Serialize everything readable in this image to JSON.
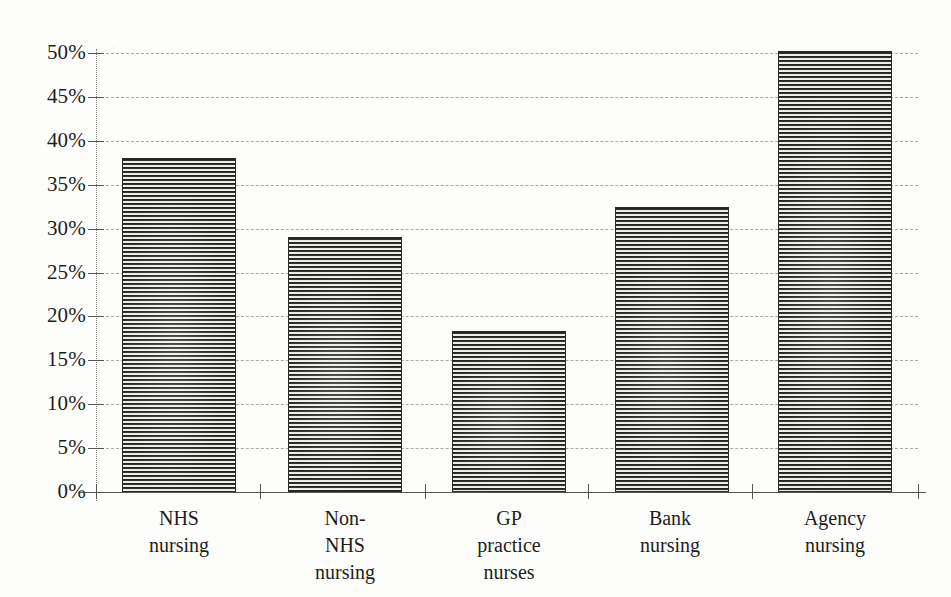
{
  "chart_data": {
    "type": "bar",
    "title": "",
    "subtitle": "",
    "xlabel": "",
    "ylabel": "",
    "categories": [
      "NHS\nnursing",
      "Non-\nNHS\nnursing",
      "GP\npractice\nnurses",
      "Bank\nnursing",
      "Agency\nnursing"
    ],
    "values": [
      38.0,
      29.0,
      18.3,
      32.5,
      50.2
    ],
    "value_labels": [
      "38%",
      "29%",
      "18.3%",
      "32.5%",
      "50.2%"
    ],
    "ylim": [
      0,
      50
    ],
    "ytick_values": [
      0,
      5,
      10,
      15,
      20,
      25,
      30,
      35,
      40,
      45,
      50
    ],
    "ytick_labels": [
      "0%",
      "5%",
      "10%",
      "15%",
      "20%",
      "25%",
      "30%",
      "35%",
      "40%",
      "45%",
      "50%"
    ],
    "grid": true,
    "grid_style": "dashed",
    "legend": false,
    "legend_position": "none",
    "series": [
      {
        "name": "",
        "values": [
          38.0,
          29.0,
          18.3,
          32.5,
          50.2
        ]
      }
    ],
    "bar_fill": "horizontal-stripe-hatch",
    "colors": {
      "bar_dark": "#1c1c1a",
      "bar_light": "#f2f2ee",
      "bar_border": "#2a2a28",
      "axis": "#55554f",
      "grid": "#9a9a96",
      "text": "#1d1d1b",
      "background": "#fdfdfb"
    }
  }
}
